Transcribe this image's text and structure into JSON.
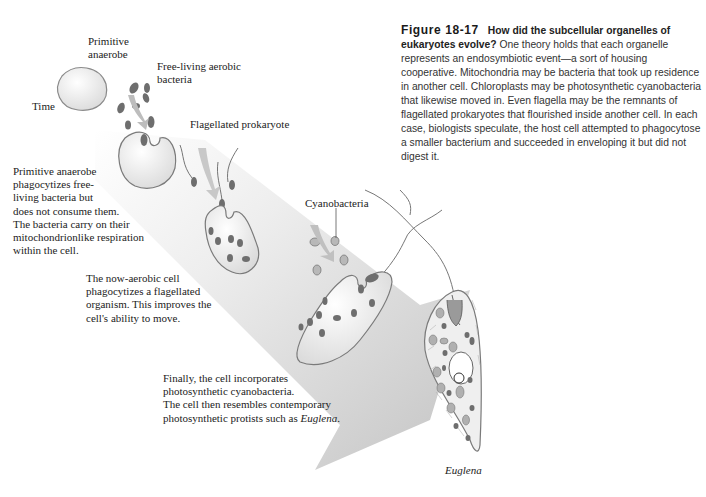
{
  "figure": {
    "number": "Figure 18-17",
    "caption_lead": "How did the subcellular organelles of eukaryotes evolve?",
    "caption_body": "One theory holds that each organelle represents an endosymbiotic event—a sort of housing cooperative. Mitochondria may be bacteria that took up residence in another cell. Chloroplasts may be photosynthetic cyanobacteria that likewise moved in. Even flagella may be the remnants of flagellated prokaryotes that flourished inside another cell. In each case, biologists speculate, the host cell attempted to phagocytose a smaller bacterium and succeeded in enveloping it but did not digest it."
  },
  "labels": {
    "primitive_anaerobe_line1": "Primitive",
    "primitive_anaerobe_line2": "anaerobe",
    "free_living_line1": "Free-living aerobic",
    "free_living_line2": "bacteria",
    "time": "Time",
    "flagellated": "Flagellated prokaryote",
    "cyanobacteria": "Cyanobacteria",
    "euglena": "Euglena"
  },
  "notes": {
    "step1": [
      "Primitive anaerobe",
      "phagocytizes free-",
      "living bacteria but",
      "does not consume them.",
      "The bacteria carry on their",
      "mitochondrionlike respiration",
      "within the cell."
    ],
    "step2": [
      "The now-aerobic cell",
      "phagocytizes a flagellated",
      "organism. This improves the",
      "cell's ability to move."
    ],
    "step3": [
      "Finally, the cell incorporates",
      "photosynthetic cyanobacteria.",
      "The cell then resembles contemporary"
    ],
    "step3_last_prefix": "photosynthetic protists such as ",
    "step3_last_italic": "Euglena",
    "step3_last_suffix": "."
  },
  "colors": {
    "arrow_band": "#d9d9d9",
    "cell_fill": "#efefef",
    "organelle": "#6e6e6e",
    "outline": "#7a7a7a"
  }
}
